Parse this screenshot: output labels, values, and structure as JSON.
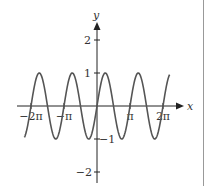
{
  "chart_data": {
    "type": "line",
    "title": "",
    "function": "y = sin(2x)",
    "xlabel": "x",
    "ylabel": "y",
    "xlim": [
      -2.3,
      2.3
    ],
    "xlim_units": "pi",
    "ylim": [
      -2.4,
      2.6
    ],
    "x_ticks": [
      {
        "value": -2,
        "label": "−2π"
      },
      {
        "value": -1,
        "label": "−π"
      },
      {
        "value": 1,
        "label": "π"
      },
      {
        "value": 2,
        "label": "2π"
      }
    ],
    "y_ticks": [
      {
        "value": 2,
        "label": "2"
      },
      {
        "value": 1,
        "label": "1"
      },
      {
        "value": -1,
        "label": "−1"
      },
      {
        "value": -2,
        "label": "−2"
      }
    ],
    "series": [
      {
        "name": "sin(2x)",
        "x_start_pi": -2.2,
        "x_end_pi": 2.2,
        "amplitude": 1,
        "period_pi": 1,
        "color": "#555555"
      }
    ],
    "grid": false,
    "legend": "none"
  },
  "colors": {
    "axis": "#222222",
    "curve": "#555555",
    "border": "#999999"
  }
}
